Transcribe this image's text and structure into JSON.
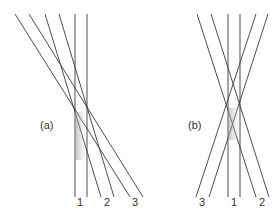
{
  "panels": [
    {
      "id": "a",
      "label": "(a)",
      "beam_labels": [
        "1",
        "2",
        "3"
      ]
    },
    {
      "id": "b",
      "label": "(b)",
      "beam_labels": [
        "3",
        "1",
        "2"
      ]
    }
  ]
}
